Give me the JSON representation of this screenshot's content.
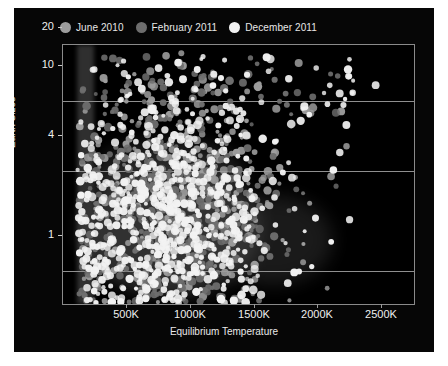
{
  "figure": {
    "background": "#060606",
    "page_background": "#ffffff"
  },
  "legend": {
    "position": "above-plot",
    "items": [
      {
        "label": "June 2010",
        "color": "#9d9d9d",
        "marker": "legend-dot-june-2010"
      },
      {
        "label": "February 2011",
        "color": "#6e6e6e",
        "marker": "legend-dot-february-2011"
      },
      {
        "label": "December 2011",
        "color": "#f2f2f2",
        "marker": "legend-dot-december-2011"
      }
    ]
  },
  "axes": {
    "y": {
      "label": "Earth Sizes",
      "scale": "log",
      "ticks": [
        "20",
        "10",
        "4",
        "1"
      ],
      "tick_values": [
        20,
        10,
        4,
        1
      ],
      "gridlines_at": [
        10,
        4,
        1
      ],
      "range": [
        0.6,
        30
      ]
    },
    "x": {
      "label": "Equilibrium Temperature",
      "scale": "linear",
      "ticks": [
        "500K",
        "1000K",
        "1500K",
        "2000K",
        "2500K"
      ],
      "tick_values": [
        500,
        1000,
        1500,
        2000,
        2500
      ],
      "range": [
        0,
        2750
      ]
    },
    "frame_color": "#8a8a8a",
    "grid_color": "#8f8f8f"
  },
  "chart_data": {
    "type": "scatter",
    "title": "",
    "xlabel": "Equilibrium Temperature",
    "ylabel": "Earth Sizes",
    "xlim": [
      0,
      2750
    ],
    "ylim": [
      0.6,
      30
    ],
    "yscale": "log",
    "xscale": "linear",
    "grid": true,
    "legend_position": "top",
    "xticks": [
      500,
      1000,
      1500,
      2000,
      2500
    ],
    "xticklabels": [
      "500K",
      "1000K",
      "1500K",
      "2000K",
      "2500K"
    ],
    "yticks": [
      20,
      10,
      4,
      1
    ],
    "yticklabels": [
      "20",
      "10",
      "4",
      "1"
    ],
    "series": [
      {
        "name": "June 2010",
        "color": "#9d9d9d",
        "n_points": 300,
        "marker_size": 3.2,
        "description": "Earliest Kepler candidate release; broadly spread, concentrated at 400-1200K and 1.5-5 Earth sizes",
        "cluster_center": [
          900,
          2.8
        ],
        "cluster_spread": [
          430,
          0.42
        ]
      },
      {
        "name": "February 2011",
        "color": "#6e6e6e",
        "n_points": 520,
        "marker_size": 3.2,
        "description": "Second release; densest between 300-1300K and 1.2-4 Earth sizes",
        "cluster_center": [
          820,
          2.4
        ],
        "cluster_spread": [
          400,
          0.4
        ]
      },
      {
        "name": "December 2011",
        "color": "#f2f2f2",
        "n_points": 900,
        "marker_size": 3.2,
        "description": "Largest release; dominates the dense low-temperature small-radius cluster and extends to 2200K",
        "cluster_center": [
          780,
          2.1
        ],
        "cluster_spread": [
          420,
          0.4
        ]
      }
    ],
    "notes": [
      "Dense core near 500-1200K and 1.5-3.5 Earth sizes",
      "Sparse scatter of large planets (10-25 Earth sizes) across all temperatures",
      "Few points beyond 2000K",
      "Vertical band of points near the low-temperature edge around 150-300K"
    ]
  }
}
